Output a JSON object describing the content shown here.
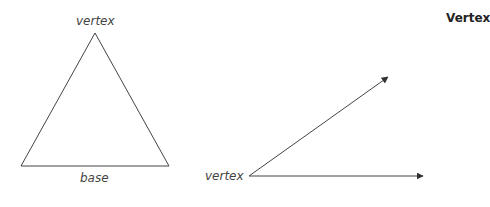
{
  "title": "Vertex",
  "triangle": {
    "vertex_label": "vertex",
    "base_label": "base",
    "points": {
      "apex": [
        95,
        33
      ],
      "left": [
        21,
        166
      ],
      "right": [
        169,
        166
      ]
    }
  },
  "angle": {
    "vertex_label": "vertex",
    "vertex": [
      249,
      176
    ],
    "ray1_end": [
      388,
      77
    ],
    "ray2_end": [
      423,
      176
    ]
  },
  "colors": {
    "stroke": "#333333",
    "text": "#444444"
  }
}
